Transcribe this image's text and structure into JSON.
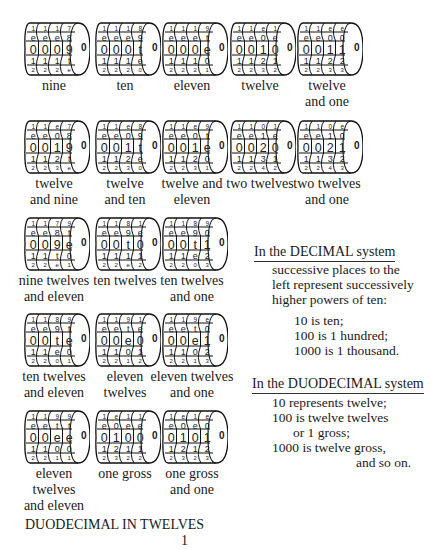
{
  "odometers": [
    {
      "label": [
        "nine"
      ],
      "cols": [
        [
          "1",
          "e",
          "0",
          "1",
          "2"
        ],
        [
          "1",
          "e",
          "0",
          "1",
          "2"
        ],
        [
          "1",
          "e",
          "0",
          "1",
          "2"
        ],
        [
          "7",
          "8",
          "9",
          "t",
          "e"
        ]
      ]
    },
    {
      "label": [
        "ten"
      ],
      "cols": [
        [
          "1",
          "e",
          "0",
          "1",
          "2"
        ],
        [
          "1",
          "e",
          "0",
          "1",
          "2"
        ],
        [
          "1",
          "e",
          "0",
          "1",
          "2"
        ],
        [
          "8",
          "9",
          "t",
          "e",
          "0"
        ]
      ]
    },
    {
      "label": [
        "eleven"
      ],
      "cols": [
        [
          "1",
          "e",
          "0",
          "1",
          "2"
        ],
        [
          "1",
          "e",
          "0",
          "1",
          "2"
        ],
        [
          "1",
          "e",
          "0",
          "1",
          "2"
        ],
        [
          "9",
          "t",
          "e",
          "0",
          "1"
        ]
      ]
    },
    {
      "label": [
        "twelve"
      ],
      "cols": [
        [
          "1",
          "e",
          "0",
          "1",
          "2"
        ],
        [
          "1",
          "e",
          "0",
          "1",
          "2"
        ],
        [
          "e",
          "0",
          "1",
          "2",
          "3"
        ],
        [
          "1",
          "e",
          "0",
          "1",
          "2"
        ]
      ]
    },
    {
      "label": [
        "twelve",
        "and one"
      ],
      "cols": [
        [
          "1",
          "e",
          "0",
          "1",
          "2"
        ],
        [
          "1",
          "e",
          "0",
          "1",
          "2"
        ],
        [
          "e",
          "0",
          "1",
          "2",
          "3"
        ],
        [
          "e",
          "0",
          "1",
          "2",
          "3"
        ]
      ]
    },
    {
      "label": [
        "twelve",
        "and nine"
      ],
      "cols": [
        [
          "1",
          "e",
          "0",
          "1",
          "2"
        ],
        [
          "1",
          "e",
          "0",
          "1",
          "2"
        ],
        [
          "e",
          "0",
          "1",
          "2",
          "3"
        ],
        [
          "7",
          "8",
          "9",
          "t",
          "e"
        ]
      ]
    },
    {
      "label": [
        "twelve",
        "and ten"
      ],
      "cols": [
        [
          "1",
          "e",
          "0",
          "1",
          "2"
        ],
        [
          "1",
          "e",
          "0",
          "1",
          "2"
        ],
        [
          "e",
          "0",
          "1",
          "2",
          "3"
        ],
        [
          "8",
          "9",
          "t",
          "e",
          "0"
        ]
      ]
    },
    {
      "label": [
        "twelve and",
        "eleven"
      ],
      "cols": [
        [
          "1",
          "e",
          "0",
          "1",
          "2"
        ],
        [
          "1",
          "e",
          "0",
          "1",
          "2"
        ],
        [
          "e",
          "0",
          "1",
          "2",
          "3"
        ],
        [
          "9",
          "t",
          "e",
          "0",
          "1"
        ]
      ]
    },
    {
      "label": [
        "two twelves"
      ],
      "cols": [
        [
          "1",
          "e",
          "0",
          "1",
          "2"
        ],
        [
          "1",
          "e",
          "0",
          "1",
          "2"
        ],
        [
          "0",
          "1",
          "2",
          "3",
          "4"
        ],
        [
          "1",
          "e",
          "0",
          "1",
          "2"
        ]
      ]
    },
    {
      "label": [
        "two twelves",
        "and one"
      ],
      "cols": [
        [
          "1",
          "e",
          "0",
          "1",
          "2"
        ],
        [
          "1",
          "e",
          "0",
          "1",
          "2"
        ],
        [
          "0",
          "1",
          "2",
          "3",
          "4"
        ],
        [
          "e",
          "0",
          "1",
          "2",
          "3"
        ]
      ]
    },
    {
      "label": [
        "nine twelves",
        "and eleven"
      ],
      "cols": [
        [
          "1",
          "e",
          "0",
          "1",
          "2"
        ],
        [
          "1",
          "e",
          "0",
          "1",
          "2"
        ],
        [
          "7",
          "8",
          "9",
          "t",
          "e"
        ],
        [
          "9",
          "t",
          "e",
          "0",
          "1"
        ]
      ]
    },
    {
      "label": [
        "ten twelves"
      ],
      "cols": [
        [
          "1",
          "e",
          "0",
          "1",
          "2"
        ],
        [
          "1",
          "e",
          "0",
          "1",
          "2"
        ],
        [
          "8",
          "9",
          "t",
          "1",
          "e"
        ],
        [
          "1",
          "e",
          "0",
          "1",
          "2"
        ]
      ]
    },
    {
      "label": [
        "ten twelves",
        "and one"
      ],
      "cols": [
        [
          "1",
          "e",
          "0",
          "1",
          "2"
        ],
        [
          "1",
          "e",
          "0",
          "1",
          "2"
        ],
        [
          "8",
          "9",
          "t",
          "e",
          "0"
        ],
        [
          "9",
          "0",
          "1",
          "2",
          "3"
        ]
      ]
    },
    {
      "label": [
        "ten twelves",
        "and eleven"
      ],
      "cols": [
        [
          "1",
          "e",
          "0",
          "1",
          "2"
        ],
        [
          "1",
          "e",
          "0",
          "1",
          "2"
        ],
        [
          "8",
          "9",
          "t",
          "e",
          "0"
        ],
        [
          "9",
          "t",
          "e",
          "0",
          "1"
        ]
      ]
    },
    {
      "label": [
        "eleven",
        "twelves"
      ],
      "cols": [
        [
          "1",
          "e",
          "0",
          "1",
          "2"
        ],
        [
          "1",
          "e",
          "0",
          "1",
          "2"
        ],
        [
          "9",
          "t",
          "e",
          "0",
          "1"
        ],
        [
          "1",
          "e",
          "0",
          "1",
          "2"
        ]
      ]
    },
    {
      "label": [
        "eleven twelves",
        "and one"
      ],
      "cols": [
        [
          "1",
          "e",
          "0",
          "1",
          "2"
        ],
        [
          "1",
          "e",
          "0",
          "1",
          "2"
        ],
        [
          "9",
          "t",
          "e",
          "0",
          "1"
        ],
        [
          "e",
          "0",
          "1",
          "2",
          "3"
        ]
      ]
    },
    {
      "label": [
        "eleven",
        "twelves",
        "and eleven"
      ],
      "cols": [
        [
          "1",
          "e",
          "0",
          "1",
          "2"
        ],
        [
          "1",
          "e",
          "0",
          "1",
          "2"
        ],
        [
          "9",
          "t",
          "e",
          "0",
          "1"
        ],
        [
          "9",
          "t",
          "e",
          "0",
          "1"
        ]
      ]
    },
    {
      "label": [
        "one gross"
      ],
      "cols": [
        [
          "1",
          "e",
          "0",
          "1",
          "2"
        ],
        [
          "e",
          "0",
          "1",
          "2",
          "3"
        ],
        [
          "1",
          "e",
          "0",
          "1",
          "2"
        ],
        [
          "1",
          "e",
          "0",
          "1",
          "2"
        ]
      ]
    },
    {
      "label": [
        "one gross",
        "and one"
      ],
      "cols": [
        [
          "1",
          "e",
          "0",
          "1",
          "2"
        ],
        [
          "e",
          "0",
          "1",
          "2",
          "3"
        ],
        [
          "1",
          "e",
          "0",
          "1",
          "2"
        ],
        [
          "e",
          "0",
          "1",
          "2",
          "3"
        ]
      ]
    }
  ],
  "hub": "0",
  "decimal": {
    "heading": "In the DECIMAL system",
    "lines": [
      "successive places to the",
      "left represent successively",
      "higher powers of ten:"
    ],
    "examples": [
      "10 is ten;",
      "100 is 1 hundred;",
      "1000 is 1 thousand."
    ]
  },
  "duodecimal": {
    "heading": "In the DUODECIMAL system",
    "lines": [
      "10 represents twelve;",
      "100 is twelve twelves",
      "or 1 gross;",
      "1000 is twelve gross,",
      "and so on."
    ]
  },
  "footer": {
    "title": "DUODECIMAL IN TWELVES",
    "page": "1"
  }
}
